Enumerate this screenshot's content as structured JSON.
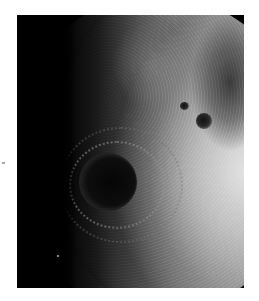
{
  "image": {
    "subject": "Moon photograph showing a large multi-ring impact basin near the terminator",
    "caption": "",
    "colors": {
      "background": "#ffffff",
      "frame": "#000000",
      "highlight": "#d0d0d0",
      "mare_dark": "#111111"
    },
    "features": [
      {
        "name": "multi-ring-basin",
        "position": "left-center"
      },
      {
        "name": "dark-crater-large",
        "position": "right-middle"
      },
      {
        "name": "dark-crater-small",
        "position": "right-middle-upper"
      },
      {
        "name": "terminator",
        "position": "left"
      }
    ]
  }
}
